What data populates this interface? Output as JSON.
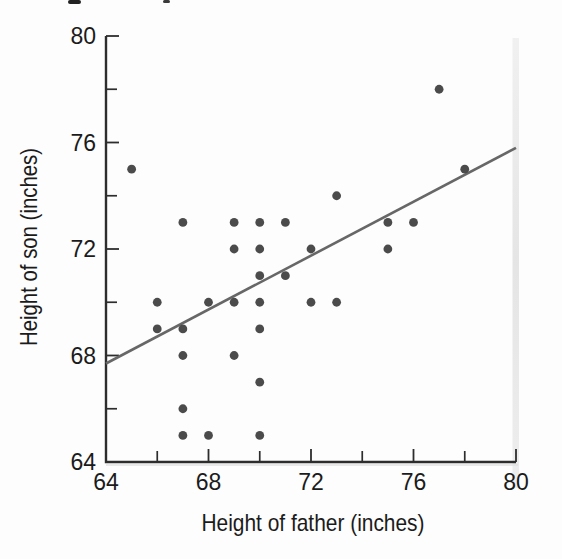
{
  "chart_data": {
    "type": "scatter",
    "title": "",
    "xlabel": "Height of father (inches)",
    "ylabel": "Height of son (inches)",
    "xlim": [
      64,
      80
    ],
    "ylim": [
      64,
      80
    ],
    "x_major_ticks": [
      64,
      68,
      72,
      76,
      80
    ],
    "x_minor_ticks": [
      66,
      70,
      74,
      78
    ],
    "y_major_ticks": [
      64,
      68,
      72,
      76,
      80
    ],
    "y_minor_ticks": [
      66,
      70,
      74,
      78
    ],
    "grid": "off",
    "legend": "none",
    "points": [
      [
        65,
        75
      ],
      [
        66,
        70
      ],
      [
        66,
        69
      ],
      [
        67,
        73
      ],
      [
        67,
        69
      ],
      [
        67,
        68
      ],
      [
        67,
        66
      ],
      [
        67,
        65
      ],
      [
        68,
        70
      ],
      [
        68,
        65
      ],
      [
        69,
        73
      ],
      [
        69,
        72
      ],
      [
        69,
        70
      ],
      [
        69,
        68
      ],
      [
        70,
        73
      ],
      [
        70,
        72
      ],
      [
        70,
        71
      ],
      [
        70,
        70
      ],
      [
        70,
        69
      ],
      [
        70,
        67
      ],
      [
        70,
        65
      ],
      [
        71,
        73
      ],
      [
        71,
        71
      ],
      [
        72,
        72
      ],
      [
        72,
        70
      ],
      [
        73,
        74
      ],
      [
        73,
        70
      ],
      [
        75,
        73
      ],
      [
        75,
        72
      ],
      [
        76,
        73
      ],
      [
        77,
        78
      ],
      [
        78,
        75
      ]
    ],
    "regression_line": {
      "x1": 64,
      "y1": 67.7,
      "x2": 80,
      "y2": 75.8
    },
    "colors": {
      "point": "#4c4c4c",
      "line": "#676767",
      "axis": "#2d2d2d",
      "text": "#1b1b1b",
      "scan_band": "#e3e3e3"
    }
  }
}
